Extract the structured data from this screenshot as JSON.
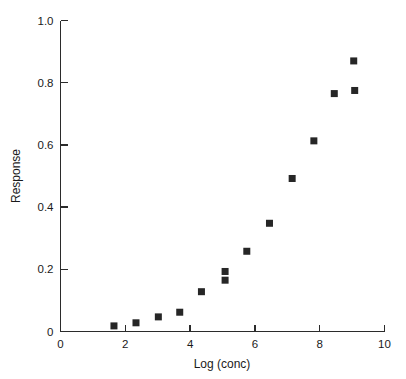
{
  "chart_data": {
    "type": "scatter",
    "title": "",
    "xlabel": "Log (conc)",
    "ylabel": "Response",
    "xlim": [
      0,
      10
    ],
    "ylim": [
      0,
      1.0
    ],
    "grid": false,
    "legend": null,
    "xticks": [
      0,
      2,
      4,
      6,
      8,
      10
    ],
    "xticklabels": [
      "0",
      "2",
      "4",
      "6",
      "8",
      "10"
    ],
    "yticks": [
      0,
      0.2,
      0.4,
      0.6,
      0.8,
      1.0
    ],
    "yticklabels": [
      "0",
      "0.2",
      "0.4",
      "0.6",
      "0.8",
      "1.0"
    ],
    "marker": "square",
    "marker_color": "#262626",
    "points": [
      {
        "x": 1.65,
        "y": 0.018
      },
      {
        "x": 2.33,
        "y": 0.028
      },
      {
        "x": 3.02,
        "y": 0.047
      },
      {
        "x": 3.68,
        "y": 0.062
      },
      {
        "x": 4.35,
        "y": 0.128
      },
      {
        "x": 5.08,
        "y": 0.193
      },
      {
        "x": 5.08,
        "y": 0.165
      },
      {
        "x": 5.75,
        "y": 0.258
      },
      {
        "x": 6.45,
        "y": 0.348
      },
      {
        "x": 7.15,
        "y": 0.492
      },
      {
        "x": 7.82,
        "y": 0.613
      },
      {
        "x": 8.45,
        "y": 0.765
      },
      {
        "x": 9.08,
        "y": 0.775
      },
      {
        "x": 9.05,
        "y": 0.87
      }
    ]
  },
  "axes": {
    "x_title": "Log (conc)",
    "y_title": "Response"
  }
}
